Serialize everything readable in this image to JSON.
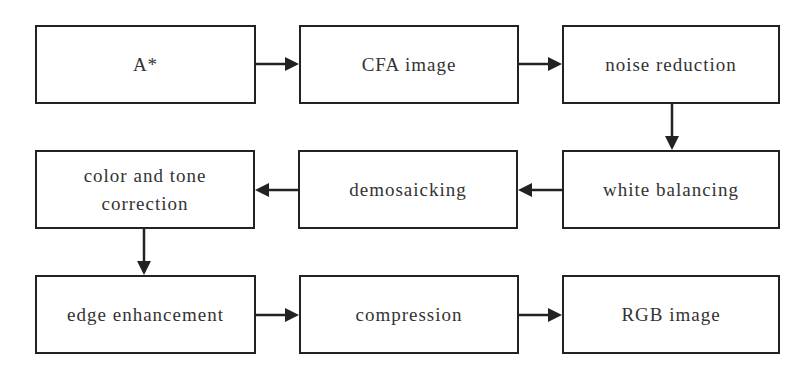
{
  "diagram": {
    "title": "",
    "colors": {
      "stroke": "#222222",
      "text": "#333333",
      "background": "#ffffff"
    },
    "nodes": [
      {
        "id": "a_star",
        "label": "A*"
      },
      {
        "id": "cfa_image",
        "label": "CFA image"
      },
      {
        "id": "noise_reduction",
        "label": "noise reduction"
      },
      {
        "id": "white_balancing",
        "label": "white balancing"
      },
      {
        "id": "demosaicking",
        "label": "demosaicking"
      },
      {
        "id": "color_tone_correction",
        "label": "color and tone correction",
        "lines": [
          "color and tone",
          "correction"
        ]
      },
      {
        "id": "edge_enhancement",
        "label": "edge enhancement"
      },
      {
        "id": "compression",
        "label": "compression"
      },
      {
        "id": "rgb_image",
        "label": "RGB image"
      }
    ],
    "edges": [
      {
        "from": "a_star",
        "to": "cfa_image"
      },
      {
        "from": "cfa_image",
        "to": "noise_reduction"
      },
      {
        "from": "noise_reduction",
        "to": "white_balancing"
      },
      {
        "from": "white_balancing",
        "to": "demosaicking"
      },
      {
        "from": "demosaicking",
        "to": "color_tone_correction"
      },
      {
        "from": "color_tone_correction",
        "to": "edge_enhancement"
      },
      {
        "from": "edge_enhancement",
        "to": "compression"
      },
      {
        "from": "compression",
        "to": "rgb_image"
      }
    ]
  }
}
